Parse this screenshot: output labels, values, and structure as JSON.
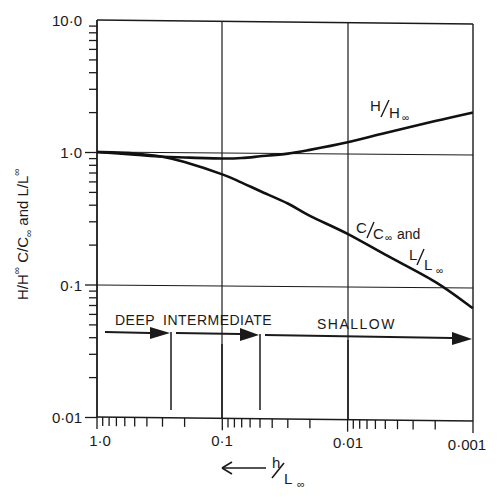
{
  "chart_data": {
    "type": "line",
    "title": "",
    "xlabel": "h/L∞",
    "xlabel_arrow": "←",
    "ylabel": "H/H∞  C/C∞ and L/L∞",
    "xscale": "log",
    "yscale": "log",
    "x_reversed": true,
    "xlim": [
      1.0,
      0.001
    ],
    "ylim": [
      0.01,
      10.0
    ],
    "x_tick_labels": [
      "1·0",
      "0·1",
      "0·01",
      "0·001"
    ],
    "y_tick_labels": [
      "10·0",
      "1·0",
      "0·1",
      "0·01"
    ],
    "grid": true,
    "series": [
      {
        "name": "H/H∞",
        "label_main": "H/H",
        "label_sub": "∞",
        "x": [
          1.0,
          0.5,
          0.3,
          0.2,
          0.1,
          0.07,
          0.05,
          0.03,
          0.02,
          0.01,
          0.005,
          0.002,
          0.001
        ],
        "y": [
          1.0,
          0.96,
          0.93,
          0.92,
          0.91,
          0.92,
          0.95,
          1.0,
          1.07,
          1.23,
          1.45,
          1.8,
          2.1
        ]
      },
      {
        "name": "C/C∞ and L/L∞",
        "label_main": "C/C",
        "label_sub": "∞",
        "label_and": "and",
        "label2_main": "L/L",
        "label2_sub": "∞",
        "x": [
          1.0,
          0.5,
          0.3,
          0.2,
          0.1,
          0.07,
          0.05,
          0.03,
          0.02,
          0.01,
          0.005,
          0.002,
          0.001
        ],
        "y": [
          1.0,
          0.98,
          0.93,
          0.85,
          0.69,
          0.6,
          0.52,
          0.42,
          0.34,
          0.25,
          0.175,
          0.11,
          0.07
        ]
      }
    ],
    "regions": [
      {
        "label": "DEEP",
        "from": 1.0,
        "to": 0.5
      },
      {
        "label": "INTERMEDIATE",
        "from": 0.5,
        "to": 0.05
      },
      {
        "label": "SHALLOW",
        "from": 0.05,
        "to": 0.001
      }
    ],
    "legend": "inline labels on curves"
  }
}
